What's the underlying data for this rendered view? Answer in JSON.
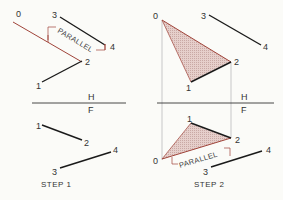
{
  "labels": {
    "point_0": "0",
    "point_1": "1",
    "point_2": "2",
    "point_3": "3",
    "point_4": "4",
    "plane_h": "H",
    "plane_f": "F",
    "parallel": "PARALLEL",
    "step1": "STEP 1",
    "step2": "STEP 2"
  },
  "colors": {
    "ink": "#1a1a1a",
    "red": "#a0443a",
    "fill": "#e3c9c5",
    "projection": "#bbbbbb",
    "background": "#fbfbf8"
  }
}
